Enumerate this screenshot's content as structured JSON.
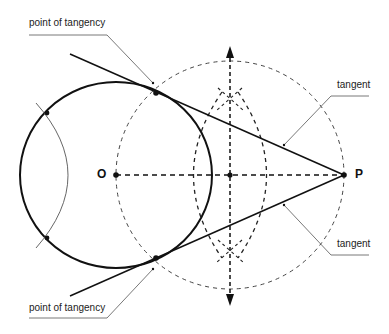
{
  "diagram": {
    "points": {
      "O": {
        "label": "O",
        "x": 116,
        "y": 175
      },
      "P": {
        "label": "P",
        "x": 344,
        "y": 175
      }
    },
    "labels": {
      "point_of_tangency_top": "point of tangency",
      "point_of_tangency_bottom": "point of tangency",
      "tangent_top": "tangent",
      "tangent_bottom": "tangent"
    },
    "colors": {
      "line": "#111111",
      "leader": "#555555",
      "dashed": "#333333"
    }
  }
}
